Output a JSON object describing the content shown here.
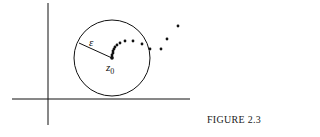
{
  "figure": {
    "caption": "FIGURE 2.3",
    "radius_label": "ε",
    "center_label": "z",
    "center_subscript": "0"
  },
  "sequence": {
    "description": "sequence of points converging to z0 inside the epsilon-disk",
    "point_count": 16
  }
}
